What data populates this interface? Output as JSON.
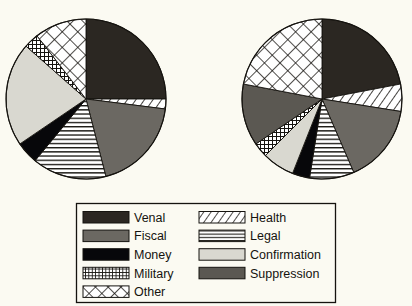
{
  "figure": {
    "background_color": "#fbfaf2",
    "ink_color": "#15130f"
  },
  "chart_data": {
    "type": "pie",
    "title": "",
    "xlabel": "",
    "ylabel": "",
    "legend_position": "bottom",
    "grid": false,
    "categories": [
      "Venal",
      "Fiscal",
      "Money",
      "Military",
      "Other",
      "Health",
      "Legal",
      "Confirmation",
      "Suppression"
    ],
    "category_fills": {
      "Venal": "#2b2722",
      "Fiscal": "#6b6862",
      "Money": "#07070a",
      "Military": "grid-hatch",
      "Other": "lattice-hatch",
      "Health": "diagonal-hatch",
      "Legal": "horizontal-lines",
      "Confirmation": "#d9d8d0",
      "Suppression": "#5b5852"
    },
    "series": [
      {
        "name": "Left pie",
        "start_angle_deg": 0,
        "direction": "clockwise",
        "slices": [
          {
            "label": "Venal",
            "value": 25.0
          },
          {
            "label": "Health",
            "value": 2.0
          },
          {
            "label": "Fiscal",
            "value": 19.0
          },
          {
            "label": "Legal",
            "value": 15.0
          },
          {
            "label": "Money",
            "value": 4.5
          },
          {
            "label": "Confirmation",
            "value": 21.0
          },
          {
            "label": "Military",
            "value": 3.0
          },
          {
            "label": "Other",
            "value": 10.5
          }
        ]
      },
      {
        "name": "Right pie",
        "start_angle_deg": 0,
        "direction": "clockwise",
        "slices": [
          {
            "label": "Venal",
            "value": 22.0
          },
          {
            "label": "Health",
            "value": 5.5
          },
          {
            "label": "Fiscal",
            "value": 16.0
          },
          {
            "label": "Legal",
            "value": 9.0
          },
          {
            "label": "Money",
            "value": 3.5
          },
          {
            "label": "Confirmation",
            "value": 6.5
          },
          {
            "label": "Military",
            "value": 3.0
          },
          {
            "label": "Suppression",
            "value": 12.5
          },
          {
            "label": "Other",
            "value": 22.0
          }
        ]
      }
    ],
    "legend": {
      "columns": 2,
      "column_left": [
        {
          "label": "Venal",
          "pattern": "solid-dark"
        },
        {
          "label": "Fiscal",
          "pattern": "solid-gray"
        },
        {
          "label": "Money",
          "pattern": "solid-black"
        },
        {
          "label": "Military",
          "pattern": "grid-hatch"
        },
        {
          "label": "Other",
          "pattern": "lattice-hatch"
        }
      ],
      "column_right": [
        {
          "label": "Health",
          "pattern": "diagonal-hatch"
        },
        {
          "label": "Legal",
          "pattern": "horizontal-lines"
        },
        {
          "label": "Confirmation",
          "pattern": "solid-light-gray"
        },
        {
          "label": "Suppression",
          "pattern": "solid-mid-gray"
        }
      ]
    }
  }
}
